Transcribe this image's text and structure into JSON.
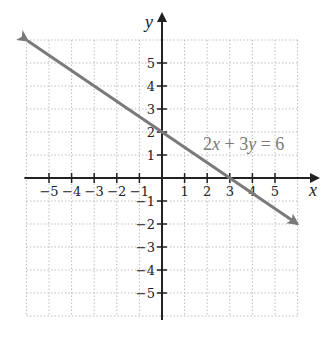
{
  "chart_data": {
    "type": "line",
    "title": "",
    "xlabel": "x",
    "ylabel": "y",
    "xlim": [
      -6,
      6
    ],
    "ylim": [
      -6,
      6
    ],
    "grid": true,
    "x_ticks": [
      -5,
      -4,
      -3,
      -2,
      -1,
      1,
      2,
      3,
      4,
      5
    ],
    "y_ticks": [
      5,
      4,
      3,
      2,
      1,
      -1,
      -2,
      -3,
      -4,
      -5
    ],
    "x_tick_labels": [
      "−5",
      "−4",
      "−3",
      "−2",
      "−1",
      "1",
      "2",
      "3",
      "4",
      "5"
    ],
    "y_tick_labels": [
      "5",
      "4",
      "3",
      "2",
      "1",
      "−1",
      "−2",
      "−3",
      "−4",
      "−5"
    ],
    "series": [
      {
        "name": "2x + 3y = 6",
        "equation": "2x + 3y = 6",
        "slope": -0.6667,
        "y_intercept": 2,
        "x_intercept": 3,
        "x": [
          -5.95,
          0,
          3,
          6
        ],
        "y": [
          5.97,
          2,
          0,
          -2
        ],
        "color": "#7a7a7a",
        "arrows_both_ends": true
      }
    ],
    "annotations": [
      {
        "text": "2x + 3y = 6",
        "x": 4.5,
        "y": 1.2
      }
    ]
  },
  "labels": {
    "x_axis": "x",
    "y_axis": "y",
    "equation_parts": [
      "2",
      "x",
      " + 3",
      "y",
      " = 6"
    ]
  },
  "colors": {
    "axis": "#222222",
    "grid": "#bdbdbd",
    "line": "#7a7a7a",
    "label": "#7a7a7a"
  }
}
